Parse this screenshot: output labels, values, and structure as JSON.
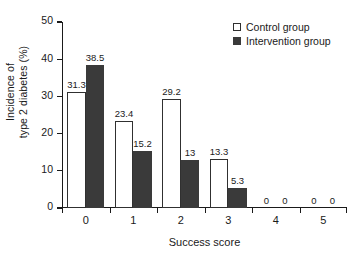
{
  "chart_data": {
    "type": "bar",
    "title": "",
    "xlabel": "Success score",
    "ylabel_line1": "Incidence of",
    "ylabel_line2": "type 2 diabetes (%)",
    "categories": [
      "0",
      "1",
      "2",
      "3",
      "4",
      "5"
    ],
    "series": [
      {
        "name": "Control group",
        "color": "#ffffff",
        "edge_color": "#303030",
        "values": [
          31.3,
          23.4,
          29.2,
          13.3,
          0,
          0
        ],
        "labels": [
          "31.3",
          "23.4",
          "29.2",
          "13.3",
          "0",
          "0"
        ]
      },
      {
        "name": "Intervention group",
        "color": "#3a3a3a",
        "edge_color": "#3a3a3a",
        "values": [
          38.5,
          15.2,
          13,
          5.3,
          0,
          0
        ],
        "labels": [
          "38.5",
          "15.2",
          "13",
          "5.3",
          "0",
          "0"
        ]
      }
    ],
    "ylim": [
      0,
      50
    ],
    "yticks": [
      0,
      10,
      20,
      30,
      40,
      50
    ],
    "ytick_labels": [
      "0",
      "10",
      "20",
      "30",
      "40",
      "50"
    ],
    "grid": false,
    "legend_position": "top-right"
  }
}
